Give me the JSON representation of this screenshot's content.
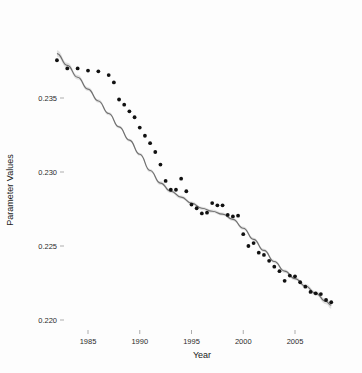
{
  "chart_data": {
    "type": "scatter",
    "title": "",
    "xlabel": "Year",
    "ylabel": "Parameter Values",
    "xlim": [
      1981.5,
      2008.8
    ],
    "ylim": [
      0.2195,
      0.2382
    ],
    "grid": false,
    "legend": null,
    "xticks": [
      1985,
      1990,
      1995,
      2000,
      2005
    ],
    "xtick_labels": [
      "1985",
      "1990",
      "1995",
      "2000",
      "2005"
    ],
    "yticks": [
      0.22,
      0.225,
      0.23,
      0.235
    ],
    "ytick_labels": [
      "0.220",
      "0.225",
      "0.230",
      "0.235"
    ],
    "x": [
      1982,
      1983,
      1984,
      1985,
      1986,
      1987,
      1987.5,
      1988,
      1988.5,
      1989,
      1989.5,
      1990,
      1990.5,
      1991,
      1991.5,
      1992,
      1992.5,
      1993,
      1993.5,
      1994,
      1994.5,
      1995,
      1995.5,
      1996,
      1996.5,
      1997,
      1997.5,
      1998,
      1998.5,
      1999,
      1999.5,
      2000,
      2000.5,
      2001,
      2001.5,
      2002,
      2002.5,
      2003,
      2003.5,
      2004,
      2004.5,
      2005,
      2005.5,
      2006,
      2006.5,
      2007,
      2007.5,
      2008,
      2008.5
    ],
    "y": [
      0.23755,
      0.237,
      0.237,
      0.23685,
      0.2368,
      0.23655,
      0.23605,
      0.2349,
      0.23455,
      0.2341,
      0.2337,
      0.233,
      0.23245,
      0.23195,
      0.23135,
      0.2305,
      0.2294,
      0.2288,
      0.2288,
      0.22955,
      0.2287,
      0.2278,
      0.22755,
      0.2272,
      0.22725,
      0.2279,
      0.22775,
      0.22775,
      0.2271,
      0.227,
      0.22705,
      0.2258,
      0.225,
      0.2252,
      0.22455,
      0.2244,
      0.224,
      0.2236,
      0.2233,
      0.22265,
      0.223,
      0.22295,
      0.22255,
      0.22225,
      0.2219,
      0.2218,
      0.22175,
      0.22135,
      0.2212
    ],
    "series": [
      {
        "name": "observations",
        "type": "scatter",
        "marker": "filled-circle",
        "color": "#111111"
      },
      {
        "name": "smoothed-fit",
        "type": "line",
        "color": "#6e6e6e",
        "band_color": "#bfbfbf",
        "fit_x": [
          1982,
          1983,
          1984,
          1985,
          1986,
          1987,
          1988,
          1989,
          1990,
          1991,
          1992,
          1993,
          1994,
          1995,
          1996,
          1997,
          1998,
          1999,
          2000,
          2001,
          2002,
          2003,
          2004,
          2005,
          2006,
          2007,
          2008,
          2008.5
        ],
        "fit_y": [
          0.238,
          0.2372,
          0.2364,
          0.2356,
          0.2348,
          0.23395,
          0.23305,
          0.23215,
          0.2312,
          0.2301,
          0.22925,
          0.2287,
          0.2283,
          0.2279,
          0.22755,
          0.22735,
          0.22715,
          0.2268,
          0.2262,
          0.22545,
          0.2247,
          0.22395,
          0.2233,
          0.2228,
          0.2223,
          0.2218,
          0.22125,
          0.221
        ],
        "band_half_width": [
          0.00022,
          0.00018,
          0.00015,
          0.00013,
          0.00012,
          0.00011,
          0.0001,
          0.0001,
          0.0001,
          0.00011,
          0.00012,
          0.00012,
          0.00011,
          0.00011,
          0.00011,
          0.00011,
          0.00011,
          0.00011,
          0.00011,
          0.00011,
          0.00011,
          0.00011,
          0.00012,
          0.00012,
          0.00013,
          0.00015,
          0.00019,
          0.00024
        ]
      }
    ]
  }
}
